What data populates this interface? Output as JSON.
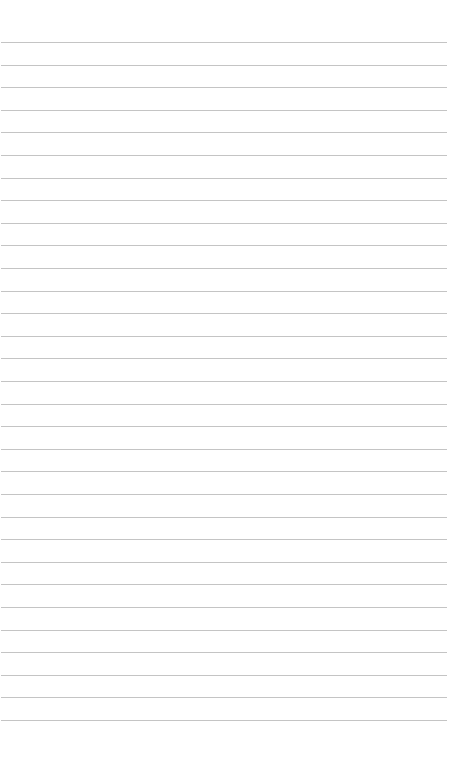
{
  "page": {
    "type": "blank lined sheet",
    "background_color": "#ffffff",
    "rule_color": "#c4c4c4",
    "rules": {
      "count": 31,
      "first_y": 42,
      "spacing": 22.6,
      "left": 1,
      "width": 446
    }
  }
}
